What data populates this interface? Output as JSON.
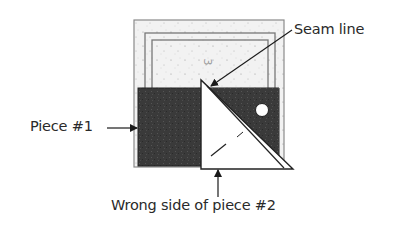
{
  "diagram": {
    "type": "quilting-block-illustration",
    "labels": {
      "piece1": "Piece #1",
      "seam_line": "Seam line",
      "wrong_side": "Wrong side of piece #2"
    },
    "block_marking": "3",
    "colors": {
      "background_fabric": "#f1f1f1",
      "dark_fabric": "#3a3a3a",
      "piece2_wrong_side": "#ffffff",
      "lines": "#333333",
      "border_lines": "#8a8a8a"
    },
    "elements": [
      "speckled background block with three nested border lines",
      "dark square piece #1 on left",
      "dark piece on right with white circle",
      "white triangle (wrong side of piece #2) overlapping with diagonal double seam line"
    ]
  }
}
